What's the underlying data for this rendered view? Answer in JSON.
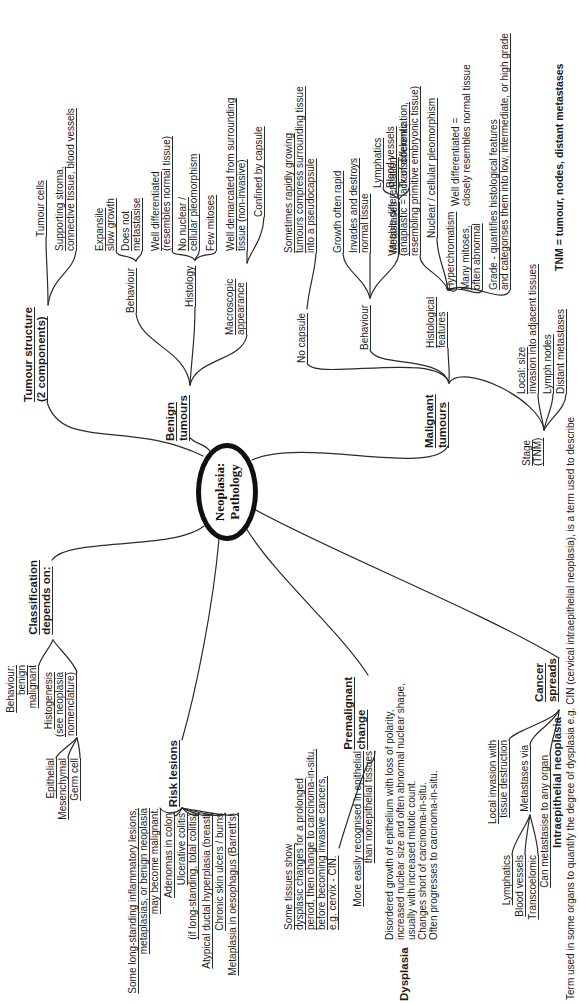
{
  "center": {
    "title": "Neoplasia:\nPathology"
  },
  "tumour_structure": {
    "label": "Tumour structure\n(2 components)",
    "tumour_cells": "Tumour cells",
    "stroma": "Supporting stroma,\nconnective tissue, blood vessels"
  },
  "benign": {
    "label": "Benign\ntumours",
    "behaviour": {
      "label": "Behaviour",
      "expansile": "Expansile\nslow growth",
      "no_metastasis": "Does not\nmetastasise"
    },
    "histology": {
      "label": "Histology",
      "well_diff": "Well differentiated\n(resembles normal tissue)",
      "no_pleomorphism": "No nuclear /\ncellular pleomorphism",
      "few_mitoses": "Few mitoses"
    },
    "macroscopic": {
      "label": "Macroscopic\nappearance",
      "demarcated": "Well demarcated from surrounding\ntissue (non-invasive)",
      "capsule": "Confined by capsule"
    }
  },
  "malignant": {
    "label": "Malignant\ntumours",
    "no_capsule": {
      "label": "No capsule",
      "note": "Sometimes rapidly growing\ntumours compress surrounding tissue\ninto a pseudocapsule"
    },
    "behaviour": {
      "label": "Behaviour",
      "rapid": "Growth often rapid",
      "invades": "Invades and destroys\nnormal tissue",
      "metastases": {
        "label": "Metastases",
        "lymphatics": "Lymphatics",
        "blood_vessels": "Blood vessels",
        "transcoelomic": "Transcoelomic"
      }
    },
    "histological": {
      "label": "Histological\nfeatures",
      "variable_diff": "Variable differentiation\n(anaplastic = lack of differentiation,\nresembling primitive embryonic tissue)",
      "pleomorphism": "Nuclear / cellular pleomorphism",
      "hyperchromatism": "Hyperchromatism",
      "mitoses": "Many mitoses,\noften abnormal",
      "grade": "Grade - quantifies histological features\nand categorises them into low, intermediate, or high grade",
      "well_diff_note": "Well differentiated =\nclosely resembles normal tissue"
    },
    "stage": {
      "label": "Stage\n(TNM)",
      "local": "Local: size\ninvasion into adjacent tissues",
      "lymph_nodes": "Lymph nodes",
      "distant": "Distant metastases"
    },
    "tnm_note": "TNM = tumour, nodes, distant metastases"
  },
  "classification": {
    "label": "Classification\ndepends on:",
    "behaviour": "Behaviour:\nbenign\nmalignant",
    "histogenesis": {
      "label": "Histogenesis\n(see neoplasia\nnomenclature)",
      "epithelial": "Epithelial",
      "mesenchymal": "Mesenchymal",
      "germ_cell": "Germ cell"
    }
  },
  "risk_lesions": {
    "label": "Risk lesions",
    "note": "Some long-standing inflammatory lesions,\nmetaplasias, or benign neoplasia\nmay become malignant.",
    "adenomas": "Adenomas in colon",
    "ulcerative": "Ulcerative colitis\n(if long-standing, total colitis)",
    "adh": "Atypical ductal hyperplasia (breast)",
    "ulcers": "Chronic skin ulcers / burns",
    "barretts": "Metaplasia in oesophagus (Barrett's)"
  },
  "premalignant": {
    "label": "Premalignant\nchange",
    "note": "Some tissues show\ndysplasic changes for a prolonged\nperiod, then change to carcinoma-in-situ,\nbefore becoming invasive cancers,\ne.g. cervix - CIN.",
    "recognised": "More easily recognised in epithelial\nthan nonepithelial tissues"
  },
  "cancer_spreads": {
    "label": "Cancer\nspreads",
    "local_invasion": "Local invasion with\ntissue destruction",
    "metastases_via": {
      "label": "Metastases via",
      "lymphatics": "Lymphatics",
      "blood_vessels": "Blood vessels",
      "transcoelomic": "Transcoelomic"
    },
    "any_organ": "Can metastasise to any organ"
  },
  "dysplasia": {
    "label": "Dysplasia",
    "text": "Disordered growth of epithelium with loss of polarity,\nincreased nuclear size and often abnormal nuclear shape,\nusually with increased mitotic count.\nChanges short of carcinoma-in-situ.\nOften progresses to carcinoma-in-situ."
  },
  "intraepithelial": {
    "label": "Intraepithelial neoplasia",
    "text": "Term used in some organs to quantify the degree of dysplasia e.g. CIN (cervical intraepithelial neoplasia), is a term used to describe"
  }
}
